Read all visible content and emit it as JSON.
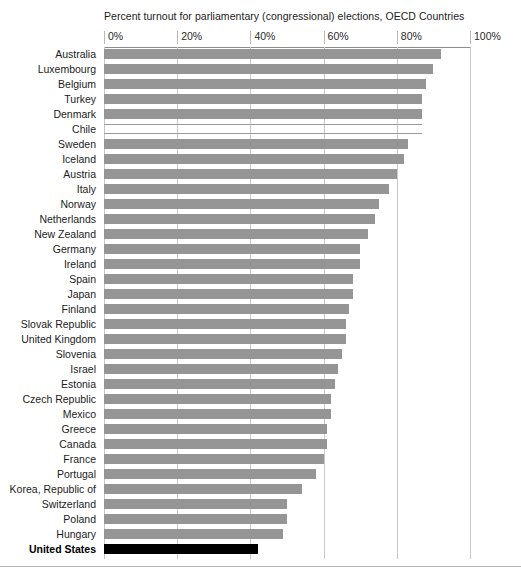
{
  "chart_data": {
    "type": "bar",
    "orientation": "horizontal",
    "title": "Percent turnout for parliamentary (congressional) elections, OECD Countries",
    "xlabel": "",
    "ylabel": "",
    "xlim": [
      0,
      100
    ],
    "xticks": [
      0,
      20,
      40,
      60,
      80,
      100
    ],
    "xtick_labels": [
      "0%",
      "20%",
      "40%",
      "60%",
      "80%",
      "100%"
    ],
    "grid": true,
    "legend": "none",
    "highlight_category": "United States",
    "highlight_color": "#000000",
    "bar_color": "#959595",
    "categories": [
      "Australia",
      "Luxembourg",
      "Belgium",
      "Turkey",
      "Denmark",
      "Chile",
      "Sweden",
      "Iceland",
      "Austria",
      "Italy",
      "Norway",
      "Netherlands",
      "New Zealand",
      "Germany",
      "Ireland",
      "Spain",
      "Japan",
      "Finland",
      "Slovak Republic",
      "United Kingdom",
      "Slovenia",
      "Israel",
      "Estonia",
      "Czech Republic",
      "Mexico",
      "Greece",
      "Canada",
      "France",
      "Portugal",
      "Korea, Republic of",
      "Switzerland",
      "Poland",
      "Hungary",
      "United States"
    ],
    "values": [
      92,
      90,
      88,
      87,
      87,
      87,
      83,
      82,
      80,
      78,
      75,
      74,
      72,
      70,
      70,
      68,
      68,
      67,
      66,
      66,
      65,
      64,
      63,
      62,
      62,
      61,
      61,
      60,
      58,
      54,
      50,
      50,
      49,
      42
    ]
  }
}
